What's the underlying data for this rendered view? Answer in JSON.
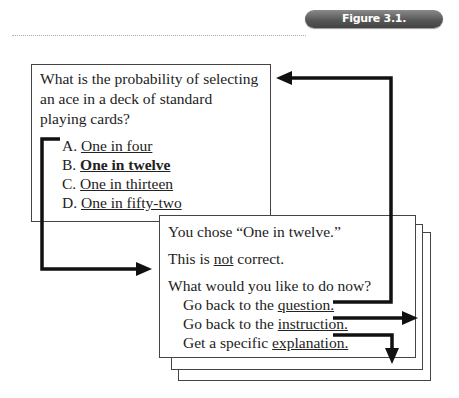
{
  "figure": {
    "label": "Figure 3.1. Hyperlinking."
  },
  "question_screen": {
    "question": "What is the probability of selecting an ace in a deck of standard playing cards?",
    "options": [
      {
        "letter": "A.",
        "text": "One in four",
        "selected": false
      },
      {
        "letter": "B.",
        "text": "One in twelve",
        "selected": true
      },
      {
        "letter": "C.",
        "text": "One in thirteen",
        "selected": false
      },
      {
        "letter": "D.",
        "text": "One in fifty-two",
        "selected": false
      }
    ]
  },
  "feedback_screen": {
    "chosen": "You chose “One in twelve.”",
    "verdict_prefix": "This is ",
    "verdict_emphasis": "not",
    "verdict_suffix": " correct.",
    "prompt": "What would you like to do now?",
    "actions": [
      {
        "prefix": "Go back to the ",
        "link": "question.",
        "target": "question_screen"
      },
      {
        "prefix": "Go back to the ",
        "link": "instruction.",
        "target": "instruction"
      },
      {
        "prefix": "Get a specific ",
        "link": "explanation.",
        "target": "explanation"
      }
    ]
  },
  "colors": {
    "arrow": "#111111",
    "box_border": "#444444",
    "badge_bg": "#555555",
    "badge_text": "#ffffff"
  }
}
